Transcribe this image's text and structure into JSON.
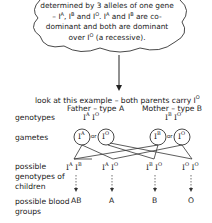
{
  "cloud": {
    "line1": "determined by 3 alleles of one",
    "line2": "gene – I",
    "text_html": "determined by 3 alleles of one gene – I<sup>A</sup>, I<sup>B</sup> and I<sup>O</sup>. I<sup>A</sup> and I<sup>B</sup> are co-dominant and both are dominant over I<sup>O</sup> (a recessive)."
  },
  "intro": "look at this example – both parents carry I",
  "intro_sup": "O",
  "parents": {
    "father": "Father – type A",
    "mother": "Mother – type B"
  },
  "labels": {
    "genotypes": "genotypes",
    "gametes": "gametes",
    "children": "possible genotypes of children",
    "blood": "possible blood groups"
  },
  "father_genotype": [
    {
      "base": "I",
      "sup": "A"
    },
    {
      "base": "I",
      "sup": "O"
    }
  ],
  "mother_genotype": [
    {
      "base": "I",
      "sup": "B"
    },
    {
      "base": "I",
      "sup": "O"
    }
  ],
  "gametes": [
    {
      "base": "I",
      "sup": "A"
    },
    {
      "base": "I",
      "sup": "O"
    },
    {
      "base": "I",
      "sup": "B"
    },
    {
      "base": "I",
      "sup": "O"
    }
  ],
  "or_label": "or",
  "children": [
    {
      "a": "A",
      "b": "B",
      "group": "AB"
    },
    {
      "a": "A",
      "b": "O",
      "group": "A"
    },
    {
      "a": "B",
      "b": "O",
      "group": "B"
    },
    {
      "a": "O",
      "b": "O",
      "group": "O"
    }
  ]
}
